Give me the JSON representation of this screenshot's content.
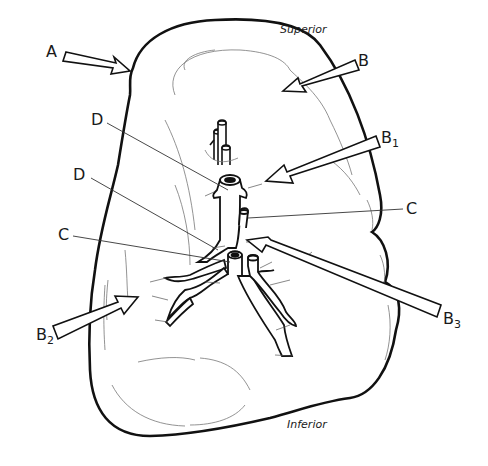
{
  "diagram": {
    "orientation": {
      "top": "Superior",
      "bottom": "Inferior"
    },
    "labels": {
      "A": {
        "text": "A",
        "sub": ""
      },
      "B": {
        "text": "B",
        "sub": ""
      },
      "B1": {
        "text": "B",
        "sub": "1"
      },
      "B2": {
        "text": "B",
        "sub": "2"
      },
      "B3": {
        "text": "B",
        "sub": "3"
      },
      "C_right": {
        "text": "C",
        "sub": ""
      },
      "C_left": {
        "text": "C",
        "sub": ""
      },
      "D_upper": {
        "text": "D",
        "sub": ""
      },
      "D_lower": {
        "text": "D",
        "sub": ""
      }
    },
    "colors": {
      "stroke": "#111111",
      "faint": "#888888",
      "background": "#ffffff"
    }
  }
}
